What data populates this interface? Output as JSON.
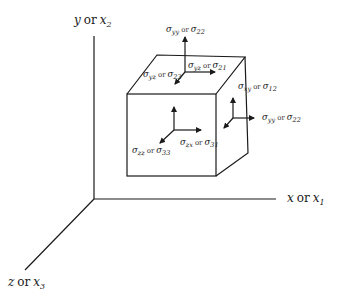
{
  "diagram": {
    "type": "stress-tensor-cube",
    "colors": {
      "line": "#1a1a1a",
      "background": "#ffffff"
    },
    "axes": {
      "y": {
        "name": "y",
        "or": "or",
        "alt": "x",
        "alt_sub": "2"
      },
      "x": {
        "name": "x",
        "or": "or",
        "alt": "x",
        "alt_sub": "1"
      },
      "z": {
        "name": "z",
        "or": "or",
        "alt": "x",
        "alt_sub": "3"
      }
    },
    "stresses": {
      "top_normal": {
        "sym": "σ",
        "sub": "yy",
        "or": "or",
        "alt": "σ",
        "alt_sub": "22"
      },
      "top_shear_x": {
        "sym": "σ",
        "sub": "yz",
        "or": "or",
        "alt": "σ",
        "alt_sub": "21"
      },
      "top_shear_z": {
        "sym": "σ",
        "sub": "yz",
        "or": "or",
        "alt": "σ",
        "alt_sub": "23"
      },
      "right_shear_y": {
        "sym": "σ",
        "sub": "xy",
        "or": "or",
        "alt": "σ",
        "alt_sub": "12"
      },
      "right_normal": {
        "sym": "σ",
        "sub": "yy",
        "or": "or",
        "alt": "σ",
        "alt_sub": "22"
      },
      "front_shear_x": {
        "sym": "σ",
        "sub": "zx",
        "or": "or",
        "alt": "σ",
        "alt_sub": "31"
      },
      "front_normal": {
        "sym": "σ",
        "sub": "zz",
        "or": "or",
        "alt": "σ",
        "alt_sub": "33"
      }
    }
  }
}
